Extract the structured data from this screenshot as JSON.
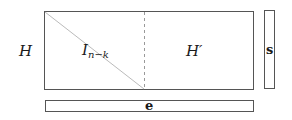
{
  "diagram": {
    "left_label": "H",
    "matrix": {
      "left_block_label_main": "I",
      "left_block_label_sub": "n−k",
      "right_block_label": "H′"
    },
    "s_vector_label": "s",
    "e_vector_label": "e",
    "colors": {
      "stroke": "#555555",
      "diagonal": "#bbbbbb",
      "dashed": "#999999",
      "text": "#1a1a1a"
    }
  }
}
